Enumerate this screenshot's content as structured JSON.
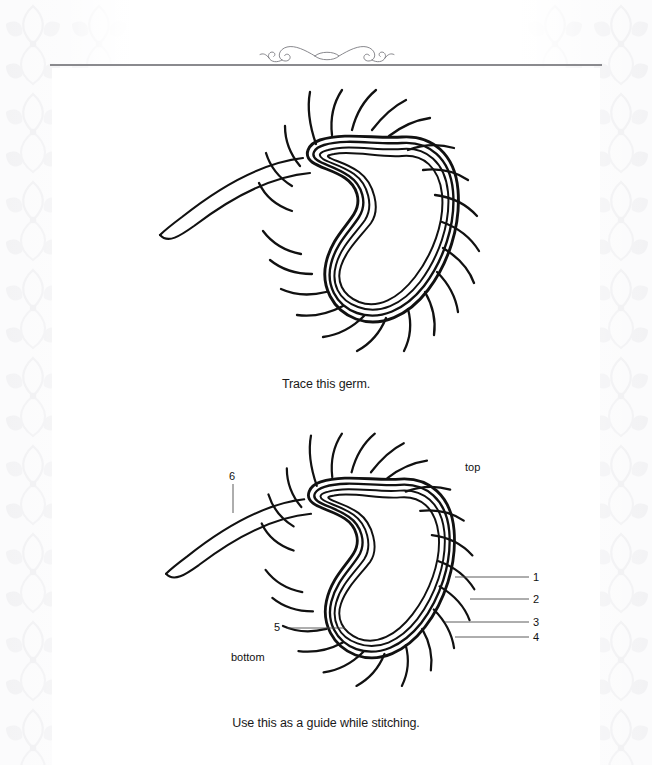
{
  "page": {
    "background_color": "#ffffff",
    "rule_color": "#8a8a8e",
    "ink_color": "#111111"
  },
  "ornament": {
    "name": "double-spiral-flourish",
    "position": "top-center"
  },
  "figures": [
    {
      "id": "trace",
      "name": "germ-trace-illustration",
      "subject": "bacterium with flagellum and pili",
      "caption": "Trace this germ."
    },
    {
      "id": "guide",
      "name": "germ-guide-illustration",
      "subject": "bacterium with flagellum and pili, numbered",
      "caption": "Use this as a guide while stitching.",
      "orientation_labels": {
        "top": "top",
        "bottom": "bottom"
      },
      "callouts": [
        {
          "number": "1",
          "side": "right"
        },
        {
          "number": "2",
          "side": "right"
        },
        {
          "number": "3",
          "side": "right"
        },
        {
          "number": "4",
          "side": "right"
        },
        {
          "number": "5",
          "side": "left"
        },
        {
          "number": "6",
          "side": "left"
        }
      ]
    }
  ]
}
